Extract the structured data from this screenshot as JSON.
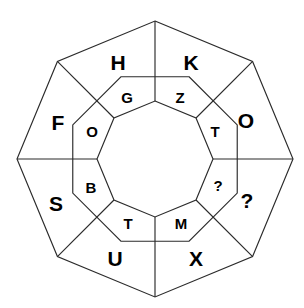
{
  "diagram": {
    "type": "concentric-octagon-wheel",
    "background_color": "#ffffff",
    "stroke_color": "#2b2b2b",
    "text_color": "#000000",
    "center": {
      "x": 155,
      "y": 159
    },
    "radii": {
      "outer": 138,
      "middle": 89,
      "inner": 58
    },
    "segment_count": 8,
    "outer_ring": {
      "name": "outer-ring",
      "cells": [
        {
          "id": "outer-1",
          "label": "H",
          "x": 118,
          "y": 62
        },
        {
          "id": "outer-2",
          "label": "K",
          "x": 191,
          "y": 62
        },
        {
          "id": "outer-3",
          "label": "O",
          "x": 246,
          "y": 120
        },
        {
          "id": "outer-4",
          "label": "?",
          "x": 247,
          "y": 200
        },
        {
          "id": "outer-5",
          "label": "X",
          "x": 196,
          "y": 258
        },
        {
          "id": "outer-6",
          "label": "U",
          "x": 115,
          "y": 258
        },
        {
          "id": "outer-7",
          "label": "S",
          "x": 56,
          "y": 203
        },
        {
          "id": "outer-8",
          "label": "F",
          "x": 58,
          "y": 122
        }
      ]
    },
    "inner_ring": {
      "name": "inner-ring",
      "cells": [
        {
          "id": "inner-1",
          "label": "G",
          "x": 127,
          "y": 97
        },
        {
          "id": "inner-2",
          "label": "Z",
          "x": 180,
          "y": 97
        },
        {
          "id": "inner-3",
          "label": "T",
          "x": 215,
          "y": 131
        },
        {
          "id": "inner-4",
          "label": "?",
          "x": 218,
          "y": 185
        },
        {
          "id": "inner-5",
          "label": "M",
          "x": 181,
          "y": 223
        },
        {
          "id": "inner-6",
          "label": "T",
          "x": 128,
          "y": 223
        },
        {
          "id": "inner-7",
          "label": "B",
          "x": 91,
          "y": 187
        },
        {
          "id": "inner-8",
          "label": "O",
          "x": 92,
          "y": 131
        }
      ]
    },
    "unknown_marker": "?"
  }
}
